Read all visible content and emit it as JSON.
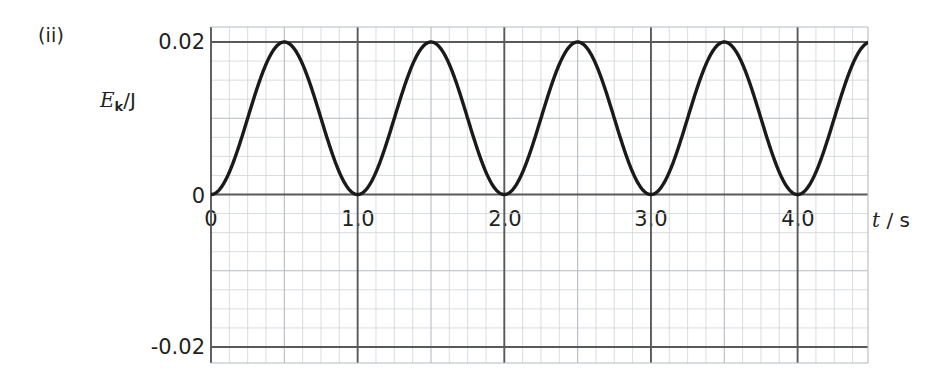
{
  "part_label": "(ii)",
  "axis": {
    "y_label_var": "E",
    "y_label_sub": "k",
    "y_label_unit": "/J",
    "x_label_var": "t",
    "x_label_unit": "/ s"
  },
  "chart_data": {
    "type": "line",
    "title": "",
    "subtitle": "",
    "xlabel": "t / s",
    "ylabel": "E_k / J",
    "xlim": [
      0.0,
      4.48
    ],
    "ylim": [
      -0.027,
      0.027
    ],
    "xticks": [
      0,
      1.0,
      2.0,
      3.0,
      4.0
    ],
    "xtick_labels": [
      "0",
      "1.0",
      "2.0",
      "3.0",
      "4.0"
    ],
    "yticks": [
      0.02,
      0,
      -0.02
    ],
    "ytick_labels": [
      "0.02",
      "0",
      "-0.02"
    ],
    "grid": true,
    "grid_minor_x_step": 0.125,
    "grid_minor_y_step": 0.0025,
    "grid_major_x_step": 0.5,
    "grid_major_y_step": 0.01,
    "legend": "none",
    "series": [
      {
        "name": "Kinetic energy",
        "equation": "E_k = 0.01*(1 - cos(2*pi*t))",
        "amplitude": 0.02,
        "period": 1.0,
        "minimum": 0.0,
        "maximum": 0.02,
        "minima_at_t": [
          0.0,
          1.0,
          2.0,
          3.0,
          4.0
        ],
        "maxima_at_t": [
          0.5,
          1.5,
          2.5,
          3.5
        ],
        "x": [
          0.0,
          0.1,
          0.2,
          0.3,
          0.4,
          0.5,
          0.6,
          0.7,
          0.8,
          0.9,
          1.0,
          1.1,
          1.2,
          1.3,
          1.4,
          1.5,
          1.6,
          1.7,
          1.8,
          1.9,
          2.0,
          2.1,
          2.2,
          2.3,
          2.4,
          2.5,
          2.6,
          2.7,
          2.8,
          2.9,
          3.0,
          3.1,
          3.2,
          3.3,
          3.4,
          3.5,
          3.6,
          3.7,
          3.8,
          3.9,
          4.0,
          4.1,
          4.2,
          4.3,
          4.4,
          4.48
        ],
        "y": [
          0.0,
          0.00191,
          0.00691,
          0.01309,
          0.01809,
          0.02,
          0.01809,
          0.01309,
          0.00691,
          0.00191,
          0.0,
          0.00191,
          0.00691,
          0.01309,
          0.01809,
          0.02,
          0.01809,
          0.01309,
          0.00691,
          0.00191,
          0.0,
          0.00191,
          0.00691,
          0.01309,
          0.01809,
          0.02,
          0.01809,
          0.01309,
          0.00691,
          0.00191,
          0.0,
          0.00191,
          0.00691,
          0.01309,
          0.01809,
          0.02,
          0.01809,
          0.01309,
          0.00691,
          0.00191,
          0.0,
          0.00191,
          0.00691,
          0.01309,
          0.01809,
          0.01994
        ]
      }
    ]
  },
  "colors": {
    "curve": "#1a1a1a",
    "axis": "#58595b",
    "grid_minor": "#cfd3d8",
    "grid_medium": "#b6bbc2",
    "text": "#231f20"
  }
}
